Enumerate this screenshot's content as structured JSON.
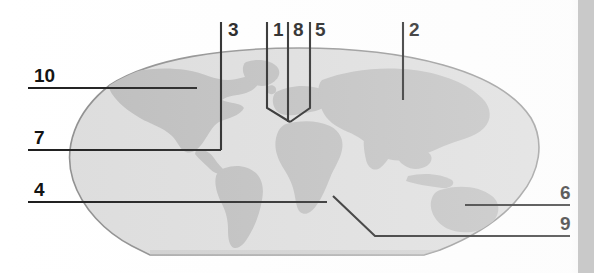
{
  "figure": {
    "type": "labeled-world-map-diagram",
    "canvas": {
      "width": 594,
      "height": 273
    },
    "colors": {
      "background": "#ffffff",
      "ocean_fill": "#dcdcdc",
      "ocean_outline": "#8d8d8d",
      "land_fill": "#bcbcbc",
      "leader_line": "#1a1a1a",
      "label_text": "#0d0d0d",
      "right_edge_strip": "#c9c9c9"
    }
  },
  "callouts": [
    {
      "id": "callout-10",
      "label": "10",
      "text_x": 34,
      "text_y": 82,
      "line": "M28,88 L197,88",
      "target_region": "north-america-northwest"
    },
    {
      "id": "callout-7",
      "label": "7",
      "text_x": 34,
      "text_y": 144,
      "line": "M28,150 L221,150",
      "target_region": "north-america-central"
    },
    {
      "id": "callout-4",
      "label": "4",
      "text_x": 34,
      "text_y": 196,
      "line": "M28,202 L327,202",
      "target_region": "south-atlantic-africa-west"
    },
    {
      "id": "callout-3",
      "label": "3",
      "text_x": 228,
      "text_y": 36,
      "line": "M221,22 L221,150",
      "target_region": "north-america-interior"
    },
    {
      "id": "callout-1",
      "label": "1",
      "text_x": 273,
      "text_y": 36,
      "line": "M267,22 L267,108 L290,122",
      "target_region": "europe-west"
    },
    {
      "id": "callout-8",
      "label": "8",
      "text_x": 293,
      "text_y": 36,
      "line": "M288,22 L288,122",
      "target_region": "mediterranean-north-africa"
    },
    {
      "id": "callout-5",
      "label": "5",
      "text_x": 315,
      "text_y": 36,
      "line": "M310,22 L310,108 L290,122",
      "target_region": "europe-east"
    },
    {
      "id": "callout-2",
      "label": "2",
      "text_x": 409,
      "text_y": 36,
      "line": "M403,22 L403,100",
      "target_region": "asia-central"
    },
    {
      "id": "callout-6",
      "label": "6",
      "text_x": 560,
      "text_y": 199,
      "line": "M465,205 L570,205",
      "target_region": "australia"
    },
    {
      "id": "callout-9",
      "label": "9",
      "text_x": 560,
      "text_y": 230,
      "line": "M333,196 L375,236 L570,236",
      "target_region": "indian-ocean-south"
    }
  ]
}
